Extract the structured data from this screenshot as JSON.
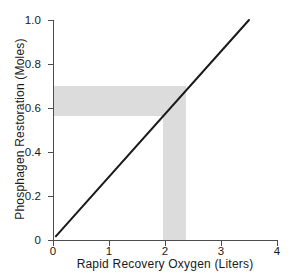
{
  "chart_data": {
    "type": "line",
    "title": "",
    "xlabel": "Rapid Recovery Oxygen (Liters)",
    "ylabel": "Phosphagen Restoration (Moles)",
    "xlim": [
      0,
      4
    ],
    "ylim": [
      0,
      1.0
    ],
    "xticks": [
      0,
      1,
      2,
      3,
      4
    ],
    "xtick_labels": [
      "0",
      "1",
      "2",
      "3",
      "4"
    ],
    "yticks": [
      0,
      0.2,
      0.4,
      0.6,
      0.8,
      1.0
    ],
    "ytick_labels": [
      "0",
      "0.2",
      "0.4",
      "0.6",
      "0.8",
      "1.0"
    ],
    "grid": false,
    "legend": null,
    "series": [
      {
        "name": "Phosphagen restoration vs rapid recovery oxygen",
        "type": "line",
        "color": "#1a1a1a",
        "linewidth": 2,
        "x": [
          0.05,
          3.5
        ],
        "y": [
          0.015,
          1.0
        ],
        "slope": 0.2855,
        "intercept": 0.0007
      }
    ],
    "annotations": [
      {
        "name": "horizontal-reference-band",
        "orientation": "horizontal",
        "y_range": [
          0.565,
          0.7
        ],
        "x_range": [
          0.0,
          2.38
        ],
        "color": "#dcdcdc"
      },
      {
        "name": "vertical-reference-band",
        "orientation": "vertical",
        "x_range": [
          1.96,
          2.38
        ],
        "y_range": [
          0.0,
          0.7
        ],
        "color": "#dcdcdc"
      }
    ],
    "axis_color": "#4d4d4d",
    "background": "#ffffff"
  },
  "axes": {
    "x_title": "Rapid Recovery Oxygen (Liters)",
    "y_title": "Phosphagen Restoration (Moles)"
  }
}
